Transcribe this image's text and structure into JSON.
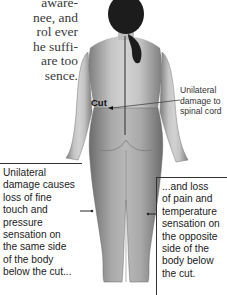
{
  "body_text": {
    "lines": [
      "aware-",
      "nee, and",
      "rol ever",
      "he suffi-",
      "are too",
      "sence."
    ]
  },
  "figure": {
    "cut_label": "Cut",
    "spinal_label_lines": [
      "Unilateral",
      "damage to",
      "spinal cord"
    ]
  },
  "callout_left": {
    "lines": [
      "Unilateral",
      "damage causes",
      "loss of fine",
      "touch and",
      "pressure",
      "sensation on",
      "the same side",
      "of the body",
      "below the cut..."
    ]
  },
  "callout_right": {
    "lines": [
      "...and loss",
      "of pain and",
      "temperature",
      "sensation on",
      "the opposite",
      "side of the",
      "body below",
      "the cut."
    ]
  },
  "colors": {
    "skin_light": "#c9c9c9",
    "skin_dark": "#8f8f8f",
    "hair": "#1c1c1c",
    "text": "#222222"
  }
}
